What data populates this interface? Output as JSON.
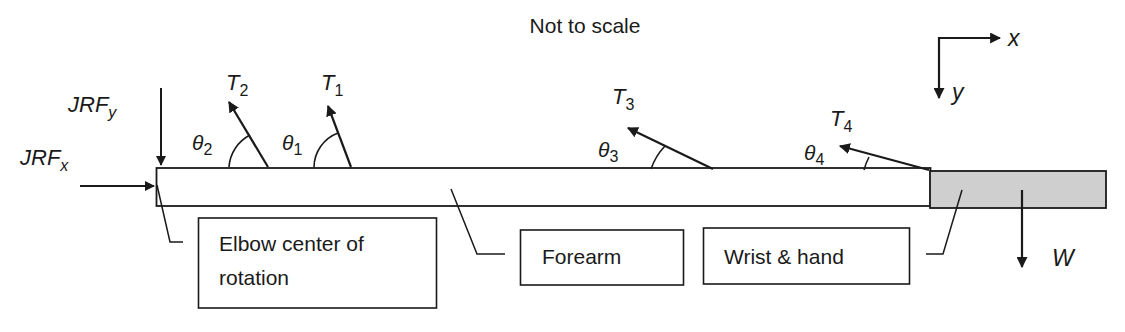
{
  "title": "Not to scale",
  "axes": {
    "x_label": "x",
    "y_label": "y"
  },
  "forces": {
    "jrf_x": {
      "main": "JRF",
      "sub": "x"
    },
    "jrf_y": {
      "main": "JRF",
      "sub": "y"
    },
    "t1": {
      "main": "T",
      "sub": "1"
    },
    "t2": {
      "main": "T",
      "sub": "2"
    },
    "t3": {
      "main": "T",
      "sub": "3"
    },
    "t4": {
      "main": "T",
      "sub": "4"
    },
    "w": {
      "main": "W"
    }
  },
  "angles": {
    "theta1": {
      "main": "θ",
      "sub": "1"
    },
    "theta2": {
      "main": "θ",
      "sub": "2"
    },
    "theta3": {
      "main": "θ",
      "sub": "3"
    },
    "theta4": {
      "main": "θ",
      "sub": "4"
    }
  },
  "labels": {
    "elbow_line1": "Elbow center of",
    "elbow_line2": "rotation",
    "forearm": "Forearm",
    "wrist_hand": "Wrist & hand"
  },
  "colors": {
    "stroke": "#1a1a1a",
    "hand_fill": "#cfcfcf",
    "forearm_fill": "#ffffff"
  }
}
